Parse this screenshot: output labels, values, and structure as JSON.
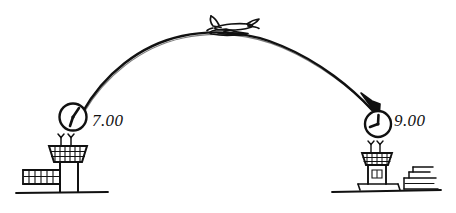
{
  "scene": {
    "title": "Flight from departure airport to arrival airport",
    "type": "hand-drawn sketch",
    "width": 456,
    "height": 213,
    "background_color": "#ffffff",
    "ink_color": "#111111"
  },
  "departure": {
    "name": "departure-airport",
    "time_label": "7.00",
    "clock_name": "departure-clock",
    "tower_name": "departure-control-tower",
    "antenna_count": 2,
    "ground_label": "ground-line-left"
  },
  "arrival": {
    "name": "arrival-airport",
    "time_label": "9.00",
    "clock_name": "arrival-clock",
    "tower_name": "arrival-control-tower",
    "antenna_count": 2,
    "ground_label": "ground-line-right"
  },
  "flight": {
    "path_name": "flight-arc",
    "arrow_name": "arrival-arrowhead",
    "plane_name": "airplane-icon",
    "direction": "left-to-right"
  }
}
